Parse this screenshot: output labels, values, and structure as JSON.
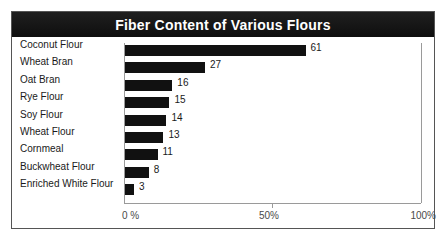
{
  "chart_data": {
    "type": "bar",
    "orientation": "horizontal",
    "title": "Fiber Content of Various Flours",
    "xlabel": "",
    "ylabel": "",
    "categories": [
      "Coconut Flour",
      "Wheat Bran",
      "Oat Bran",
      "Rye Flour",
      "Soy Flour",
      "Wheat Flour",
      "Cornmeal",
      "Buckwheat  Flour",
      "Enriched White Flour"
    ],
    "values": [
      61,
      27,
      16,
      15,
      14,
      13,
      11,
      8,
      3
    ],
    "value_labels": [
      "61",
      "27",
      "16",
      "15",
      "14",
      "13",
      "11",
      "8",
      "3"
    ],
    "xlim": [
      0,
      100
    ],
    "xticks": [
      0,
      50,
      100
    ],
    "xtick_labels": [
      "0 %",
      "50%",
      "100%"
    ],
    "grid": false,
    "legend": false,
    "bar_color": "#111111",
    "title_background": "#161616",
    "title_color": "#ffffff",
    "axis_color": "#9a9a9a",
    "frame_color": "#555555",
    "background": "#ffffff"
  }
}
